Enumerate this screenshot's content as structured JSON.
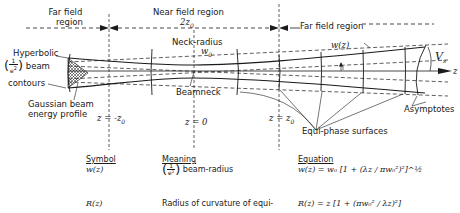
{
  "regions": {
    "far_field_left": [
      "Far field",
      "region"
    ],
    "near_field": "Near field region",
    "near_field_width": "2z",
    "near_field_width_sub": "0",
    "far_field_right": "Far field region"
  },
  "labels": {
    "hyperbolic": "Hyperbolic",
    "beam": "beam",
    "contours": "contours",
    "frac_num": "1",
    "frac_den": "e",
    "frac_den_sup": "2",
    "gaussian_profile": [
      "Gaussian beam",
      "energy profile"
    ],
    "neck_radius": "Neck-radius",
    "w0": "w",
    "w0_sub": "0",
    "beamneck": "Beamneck",
    "wz": "w(z)",
    "theta": "V",
    "theta_sub": "s",
    "z_axis": "z",
    "equiphase": "Equi-phase surfaces",
    "asymptotes": "Asymptotes",
    "z_neg": "z = -z",
    "z_neg_sub": "0",
    "z_zero": "z = 0",
    "z_pos": "z = z",
    "z_pos_sub": "0"
  },
  "table": {
    "headers": [
      "Symbol",
      "Meaning",
      "Equation"
    ],
    "rows": [
      {
        "symbol": "w(z)",
        "meaning": "beam-radius",
        "meaning_frac_num": "1",
        "meaning_frac_den": "e²",
        "equation": "w(z) = w₀ [1 + (λz / πw₀²)²]^½"
      },
      {
        "symbol": "R(z)",
        "meaning": "Radius of curvature of equi-",
        "equation": "R(z) = z [1 + (πw₀² / λz)²]"
      }
    ]
  },
  "colors": {
    "ink": "#1a1a1a",
    "background": "#ffffff"
  }
}
